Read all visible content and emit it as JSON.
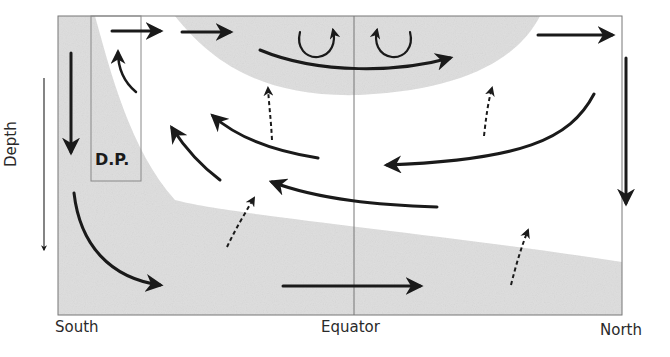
{
  "diagram": {
    "type": "ocean meridional overturning circulation schematic",
    "labels": {
      "south": "South",
      "equator": "Equator",
      "north": "North",
      "depth": "Depth",
      "dp": "D.P."
    },
    "colors": {
      "shading": "#dedede",
      "arrow": "#1a1a1a",
      "frame": "#777777"
    },
    "arrows": [
      {
        "id": "surface-south-1",
        "style": "solid",
        "direction": "east",
        "region": "surface, south (inside D.P.)"
      },
      {
        "id": "surface-south-2",
        "style": "solid",
        "direction": "east",
        "region": "surface, south"
      },
      {
        "id": "surface-equator-curve",
        "style": "solid",
        "direction": "east",
        "region": "upper bowl across equator"
      },
      {
        "id": "eddy-left",
        "style": "solid",
        "direction": "clockwise loop",
        "region": "upper bowl, south of equator"
      },
      {
        "id": "eddy-right",
        "style": "solid",
        "direction": "counter-clockwise loop",
        "region": "upper bowl, north of equator"
      },
      {
        "id": "surface-north",
        "style": "solid",
        "direction": "east",
        "region": "surface, north"
      },
      {
        "id": "downwelling-north",
        "style": "solid",
        "direction": "down",
        "region": "northern boundary"
      },
      {
        "id": "downwelling-south",
        "style": "solid",
        "direction": "down",
        "region": "southern boundary"
      },
      {
        "id": "upwelling-dp",
        "style": "solid",
        "direction": "up",
        "region": "Drake Passage"
      },
      {
        "id": "deep-south-curve",
        "style": "solid",
        "direction": "south-east",
        "region": "deep south"
      },
      {
        "id": "abyssal-east",
        "style": "solid",
        "direction": "east",
        "region": "abyss at equator"
      },
      {
        "id": "return-1",
        "style": "solid",
        "direction": "north-west",
        "region": "mid-depth, south"
      },
      {
        "id": "return-2",
        "style": "solid",
        "direction": "west",
        "region": "mid-depth"
      },
      {
        "id": "return-3",
        "style": "solid",
        "direction": "west",
        "region": "mid-depth, across equator"
      },
      {
        "id": "return-4",
        "style": "solid",
        "direction": "west",
        "region": "mid-depth, north"
      },
      {
        "id": "mix-1",
        "style": "dashed",
        "direction": "up",
        "region": "below upper bowl, south"
      },
      {
        "id": "mix-2",
        "style": "dashed",
        "direction": "up",
        "region": "below upper bowl, north"
      },
      {
        "id": "mix-3",
        "style": "dashed",
        "direction": "up",
        "region": "abyssal boundary, south"
      },
      {
        "id": "mix-4",
        "style": "dashed",
        "direction": "up",
        "region": "abyssal boundary, north"
      }
    ]
  }
}
